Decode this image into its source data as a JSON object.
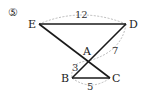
{
  "problem": {
    "number": "⑤"
  },
  "points": {
    "E": {
      "label": "E",
      "x": 39,
      "y": 24
    },
    "D": {
      "label": "D",
      "x": 126,
      "y": 24
    },
    "A": {
      "label": "A",
      "x": 88,
      "y": 61
    },
    "B": {
      "label": "B",
      "x": 72,
      "y": 78
    },
    "C": {
      "label": "C",
      "x": 110,
      "y": 78
    }
  },
  "lengths": {
    "ED": "12",
    "AD": "7",
    "AB": "3",
    "BC": "5"
  },
  "colors": {
    "line": "#1a1a1a",
    "dimension_arc": "#aaaaaa",
    "text": "#222222"
  }
}
